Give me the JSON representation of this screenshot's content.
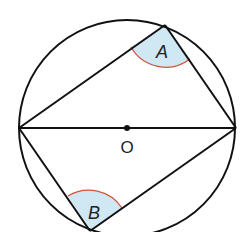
{
  "diagram": {
    "type": "inscribed-angles-in-circle",
    "center_label": "O",
    "angle_labels": {
      "a": "A",
      "b": "B"
    },
    "geometry": {
      "center": [
        127,
        128
      ],
      "radius": 108,
      "points": {
        "left": [
          19,
          128
        ],
        "right": [
          236,
          128
        ],
        "A": [
          165,
          25
        ],
        "B": [
          90,
          231
        ]
      }
    },
    "colors": {
      "stroke": "#111111",
      "angle_fill": "#cfe8f4",
      "angle_arc": "#d0553a"
    }
  }
}
